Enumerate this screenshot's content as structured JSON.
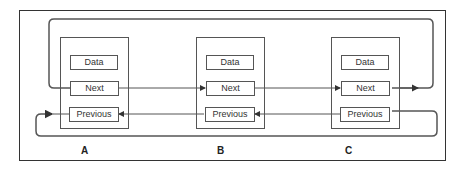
{
  "diagram": {
    "type": "doubly-circular-linked-list",
    "nodes": [
      {
        "id": "A",
        "label": "A",
        "fields": {
          "data": "Data",
          "next": "Next",
          "previous": "Previous"
        }
      },
      {
        "id": "B",
        "label": "B",
        "fields": {
          "data": "Data",
          "next": "Next",
          "previous": "Previous"
        }
      },
      {
        "id": "C",
        "label": "C",
        "fields": {
          "data": "Data",
          "next": "Next",
          "previous": "Previous"
        }
      }
    ],
    "edges": [
      {
        "from": "A.Next",
        "to": "B.Next"
      },
      {
        "from": "B.Next",
        "to": "C.Next"
      },
      {
        "from": "C.Next",
        "to": "A.Next",
        "route": "wrap-top"
      },
      {
        "from": "C.Previous",
        "to": "B.Previous"
      },
      {
        "from": "B.Previous",
        "to": "A.Previous"
      },
      {
        "from": "A.Previous",
        "to": "C.Previous",
        "route": "wrap-bottom"
      }
    ],
    "colors": {
      "line": "#555555",
      "frame": "#333333",
      "background": "#ffffff"
    }
  }
}
